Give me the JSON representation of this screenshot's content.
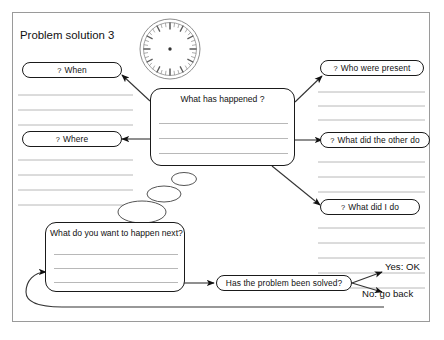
{
  "document": {
    "title": "Problem solution 3"
  },
  "clock": {
    "icon": "clock-face-icon"
  },
  "boxes": {
    "center": {
      "title": "What has happened ?",
      "line_count": 3
    },
    "next": {
      "title": "What do you want to happen next?",
      "line_count": 3
    }
  },
  "prompts": {
    "left": [
      {
        "qmark": "?",
        "label": "When"
      },
      {
        "qmark": "?",
        "label": "Where"
      }
    ],
    "right": [
      {
        "qmark": "?",
        "label": "Who were present"
      },
      {
        "qmark": "?",
        "label": "What did the other do"
      },
      {
        "qmark": "?",
        "label": "What did I do"
      }
    ]
  },
  "decision": {
    "label": "Has the problem been solved?",
    "yes_label": "Yes: OK",
    "no_label": "No: go back"
  },
  "colors": {
    "ink": "#1a1a1a",
    "rule": "#b8b8b8",
    "sheet_border": "#9a9a9a",
    "paper": "#ffffff"
  }
}
